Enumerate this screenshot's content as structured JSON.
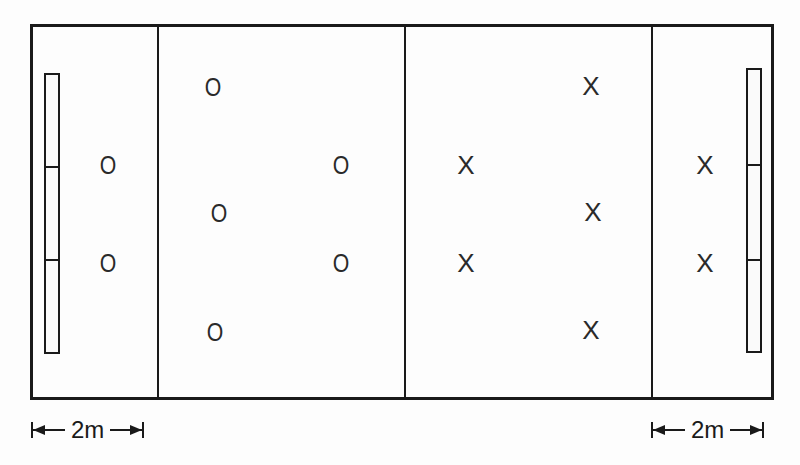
{
  "diagram": {
    "type": "handball/court formation diagram",
    "colors": {
      "line": "#1a1a1a",
      "background": "#fdfdfd"
    },
    "court": {
      "zones": [
        "left-end-zone",
        "left-half",
        "right-half",
        "right-end-zone"
      ]
    },
    "team_o": {
      "symbol": "O",
      "players": [
        {
          "x": 108,
          "y": 165,
          "label": "O"
        },
        {
          "x": 108,
          "y": 263,
          "label": "O"
        },
        {
          "x": 213,
          "y": 87,
          "label": "O"
        },
        {
          "x": 219,
          "y": 213,
          "label": "O"
        },
        {
          "x": 215,
          "y": 332,
          "label": "O"
        },
        {
          "x": 341,
          "y": 165,
          "label": "O"
        },
        {
          "x": 341,
          "y": 263,
          "label": "O"
        }
      ]
    },
    "team_x": {
      "symbol": "X",
      "players": [
        {
          "x": 466,
          "y": 165,
          "label": "X"
        },
        {
          "x": 466,
          "y": 263,
          "label": "X"
        },
        {
          "x": 591,
          "y": 86,
          "label": "X"
        },
        {
          "x": 593,
          "y": 212,
          "label": "X"
        },
        {
          "x": 591,
          "y": 330,
          "label": "X"
        },
        {
          "x": 705,
          "y": 165,
          "label": "X"
        },
        {
          "x": 705,
          "y": 263,
          "label": "X"
        }
      ]
    },
    "dimensions": {
      "left": {
        "label": "2m"
      },
      "right": {
        "label": "2m"
      }
    }
  }
}
